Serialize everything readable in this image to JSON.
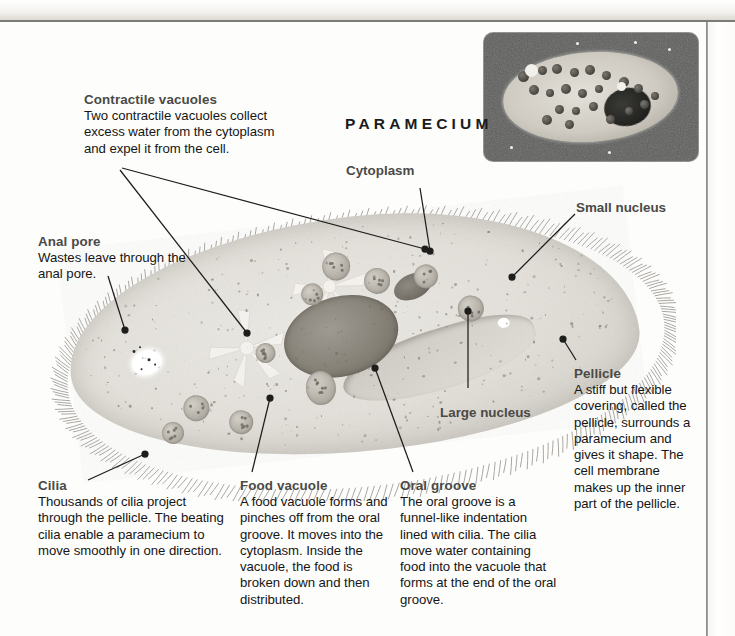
{
  "title": "PARAMECIUM",
  "figure": {
    "organism": "Paramecium",
    "micrograph_alt": "light micrograph of a paramecium",
    "labels": {
      "cytoplasm": "Cytoplasm",
      "small_nucleus": "Small nucleus",
      "large_nucleus": "Large nucleus"
    }
  },
  "callouts": [
    {
      "id": "contractile-vacuoles",
      "heading": "Contractile vacuoles",
      "body": "Two contractile vacuoles collect excess water from the cytoplasm and expel it from the cell."
    },
    {
      "id": "anal-pore",
      "heading": "Anal pore",
      "body": "Wastes leave through the anal pore."
    },
    {
      "id": "cilia",
      "heading": "Cilia",
      "body": "Thousands of cilia project through the pellicle. The beating cilia enable a paramecium to move smoothly in one direction."
    },
    {
      "id": "food-vacuole",
      "heading": "Food vacuole",
      "body": "A food vacuole forms and pinches off from the oral groove. It moves into the cytoplasm. Inside the vacuole, the food is broken down and then distributed."
    },
    {
      "id": "oral-groove",
      "heading": "Oral groove",
      "body": "The oral groove is a funnel-like indentation lined with cilia. The cilia move water containing food into the vacuole that forms at the end of the oral groove."
    },
    {
      "id": "pellicle",
      "heading": "Pellicle",
      "body": "A stiff but flexible covering, called the pellicle, surrounds a paramecium and gives it shape. The cell membrane makes up the inner part of the pellicle."
    }
  ],
  "colors": {
    "heading": "#4b4a46",
    "body_text": "#151515",
    "leader_line": "#1d1d1b",
    "cell_fill": "#e4e1db",
    "nucleus": "#7f7a71",
    "micrograph_bg": "#5e5e5c"
  }
}
